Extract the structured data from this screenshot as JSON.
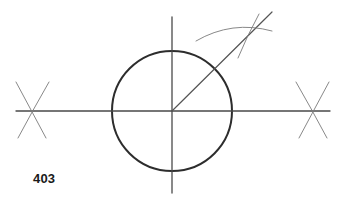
{
  "figure": {
    "label": "403",
    "kind": "geometric-construction-drawing",
    "background_color": "#ffffff",
    "canvas": {
      "width": 339,
      "height": 206
    },
    "colors": {
      "circle_stroke": "#2d2d2d",
      "axis_stroke": "#4a4a4a",
      "radius_stroke": "#555555",
      "construction_stroke": "#7a7a7a",
      "label_text": "#1a1a1a"
    },
    "stroke_widths": {
      "circle": 2.0,
      "axis": 1.3,
      "radius": 1.2,
      "construction": 0.9
    },
    "circle": {
      "center_x": 172,
      "center_y": 111,
      "radius": 60
    },
    "horizontal_axis": {
      "x1": 16,
      "y1": 111,
      "x2": 330,
      "y2": 111
    },
    "vertical_axis": {
      "x1": 172,
      "y1": 17,
      "x2": 172,
      "y2": 193
    },
    "radius_line": {
      "x1": 172,
      "y1": 111,
      "x2": 272,
      "y2": 12,
      "description": "radius drawn from center up and to the right at approximately 45 degrees"
    },
    "arc_cross_left": {
      "center_x": 32,
      "center_y": 111,
      "description": "two compass arcs intersecting on the horizontal axis left of the circle",
      "arc_a": {
        "x1": 16,
        "y1": 82,
        "cx": 30,
        "cy": 108,
        "x2": 46,
        "y2": 138
      },
      "arc_b": {
        "x1": 49,
        "y1": 82,
        "cx": 34,
        "cy": 108,
        "x2": 18,
        "y2": 138
      }
    },
    "arc_cross_right": {
      "center_x": 313,
      "center_y": 111,
      "description": "two compass arcs intersecting on the horizontal axis right of the circle",
      "arc_a": {
        "x1": 329,
        "y1": 82,
        "cx": 315,
        "cy": 108,
        "x2": 299,
        "y2": 138
      },
      "arc_b": {
        "x1": 296,
        "y1": 82,
        "cx": 311,
        "cy": 108,
        "x2": 327,
        "y2": 138
      }
    },
    "arc_cross_upper_right": {
      "center_x": 255,
      "center_y": 27,
      "description": "two light construction arcs intersecting above and right of the circle, on the radius line",
      "arc_sweeping": {
        "x1": 196,
        "y1": 41,
        "cx": 232,
        "cy": 20,
        "x2": 272,
        "y2": 31
      },
      "arc_crossing": {
        "x1": 259,
        "y1": 14,
        "cx": 247,
        "cy": 36,
        "x2": 238,
        "y2": 58
      }
    }
  }
}
